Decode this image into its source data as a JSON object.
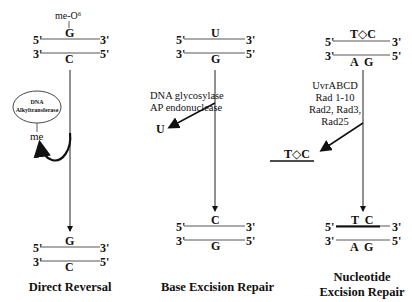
{
  "panels": [
    {
      "id": "direct-reversal",
      "title": "Direct Reversal",
      "top_duplex": {
        "strand1": {
          "left": "5'",
          "base": "G",
          "right": "3'"
        },
        "strand2": {
          "left": "3'",
          "base": "C",
          "right": "5'"
        },
        "modification": "me-O⁶"
      },
      "enzyme": {
        "line1": "DNA",
        "line2": "Alkyltransferase"
      },
      "removed_group": "me",
      "bottom_duplex": {
        "strand1": {
          "left": "5'",
          "base": "G",
          "right": "3'"
        },
        "strand2": {
          "left": "3'",
          "base": "C",
          "right": "5'"
        }
      }
    },
    {
      "id": "base-excision-repair",
      "title": "Base Excision Repair",
      "top_duplex": {
        "strand1": {
          "left": "5'",
          "base": "U",
          "right": "3'"
        },
        "strand2": {
          "left": "3'",
          "base": "G",
          "right": "5'"
        }
      },
      "enzymes": [
        "DNA glycosylase",
        "AP endonuclease"
      ],
      "removed_group": "U",
      "bottom_duplex": {
        "strand1": {
          "left": "5'",
          "base": "C",
          "right": "3'"
        },
        "strand2": {
          "left": "3'",
          "base": "G",
          "right": "5'"
        }
      }
    },
    {
      "id": "nucleotide-excision-repair",
      "title_line1": "Nucleotide",
      "title_line2": "Excision Repair",
      "top_duplex": {
        "strand1": {
          "left": "5'",
          "base": "T◇C",
          "right": "3'"
        },
        "strand2": {
          "left": "3'",
          "base": "A  G",
          "right": "5'"
        }
      },
      "enzymes": [
        "UvrABCD",
        "Rad 1-10",
        "Rad2, Rad3,",
        "Rad25"
      ],
      "removed_group": "T◇C",
      "bottom_duplex": {
        "strand1": {
          "left": "5'",
          "base": "T  C",
          "right": "3'"
        },
        "strand2": {
          "left": "3'",
          "base": "A  G",
          "right": "5'"
        }
      }
    }
  ]
}
